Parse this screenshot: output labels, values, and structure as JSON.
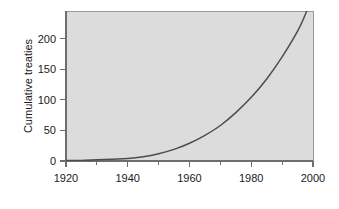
{
  "chart_data": {
    "type": "line",
    "title": "",
    "subtitle": "",
    "xlabel": "",
    "ylabel": "Cumulative treaties",
    "xlim": [
      1920,
      2000
    ],
    "ylim": [
      0,
      245
    ],
    "grid": false,
    "legend": null,
    "background_color": "#dcdcdc",
    "line_color": "#4d4d4d",
    "axis_color": "#6e6e6e",
    "x_ticks": [
      1920,
      1940,
      1960,
      1980,
      2000
    ],
    "x_tick_labels": [
      "1920",
      "1940",
      "1960",
      "1980",
      "2000"
    ],
    "x_minor_ticks": [
      1930,
      1950,
      1970,
      1990
    ],
    "y_ticks": [
      0,
      50,
      100,
      150,
      200
    ],
    "y_tick_labels": [
      "0",
      "50",
      "100",
      "150",
      "200"
    ],
    "x": [
      1920,
      1925,
      1930,
      1935,
      1940,
      1945,
      1950,
      1955,
      1960,
      1965,
      1970,
      1975,
      1980,
      1985,
      1990,
      1995,
      1998
    ],
    "values": [
      1,
      1,
      2,
      3,
      4,
      7,
      12,
      19,
      29,
      42,
      58,
      79,
      104,
      134,
      170,
      212,
      245
    ],
    "series": [
      {
        "name": "Cumulative treaties",
        "values": [
          1,
          1,
          2,
          3,
          4,
          7,
          12,
          19,
          29,
          42,
          58,
          79,
          104,
          134,
          170,
          212,
          245
        ]
      }
    ],
    "annotations": []
  }
}
